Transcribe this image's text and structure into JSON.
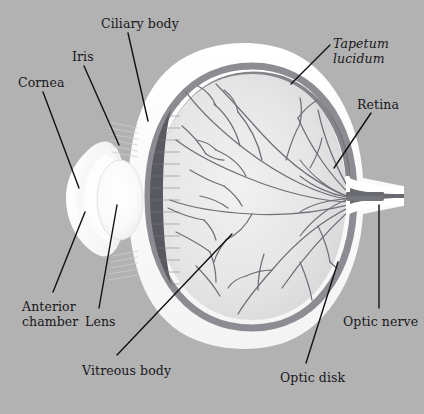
{
  "figure": {
    "kind": "anatomical-diagram",
    "background_color": "#b2b2b2",
    "label_color": "#17171a",
    "leader_line_color": "#111114"
  },
  "palette": {
    "sclera_white": "#ffffff",
    "outer_glow": "#f2f2f2",
    "retina_gray": "#8d8d92",
    "choroid_dark": "#5a5a61",
    "ciliary_dark": "#5b5b62",
    "vitreous_light": "#e9e9ea",
    "vitreous_shade": "#dcdcdd",
    "lens_white": "#fdfdfd",
    "vessel_gray": "#6e6e76",
    "optic_nerve_dark": "#6a6a71"
  },
  "labels": [
    {
      "id": "ciliary-body",
      "text": "Ciliary body",
      "x": 101,
      "y": 17,
      "italic": false
    },
    {
      "id": "tapetum-lucidum",
      "text": "Tapetum\nlucidum",
      "x": 333,
      "y": 37,
      "italic": true
    },
    {
      "id": "iris",
      "text": "Iris",
      "x": 72,
      "y": 50,
      "italic": false
    },
    {
      "id": "cornea",
      "text": "Cornea",
      "x": 18,
      "y": 76,
      "italic": false
    },
    {
      "id": "retina",
      "text": "Retina",
      "x": 357,
      "y": 98,
      "italic": false
    },
    {
      "id": "anterior-chamber",
      "text": "Anterior\nchamber",
      "x": 22,
      "y": 300,
      "italic": false
    },
    {
      "id": "lens",
      "text": "Lens",
      "x": 85,
      "y": 315,
      "italic": false
    },
    {
      "id": "optic-nerve",
      "text": "Optic nerve",
      "x": 343,
      "y": 315,
      "italic": false
    },
    {
      "id": "vitreous-body",
      "text": "Vitreous body",
      "x": 82,
      "y": 364,
      "italic": false
    },
    {
      "id": "optic-disk",
      "text": "Optic disk",
      "x": 280,
      "y": 371,
      "italic": false
    }
  ],
  "leader_lines": [
    {
      "id": "leader-ciliary-body",
      "x1": 128,
      "y1": 33,
      "x2": 148,
      "y2": 121
    },
    {
      "id": "leader-tapetum-lucidum",
      "x1": 330,
      "y1": 45,
      "x2": 291,
      "y2": 84
    },
    {
      "id": "leader-iris",
      "x1": 84,
      "y1": 66,
      "x2": 119,
      "y2": 145
    },
    {
      "id": "leader-cornea",
      "x1": 43,
      "y1": 92,
      "x2": 79,
      "y2": 188
    },
    {
      "id": "leader-retina",
      "x1": 371,
      "y1": 113,
      "x2": 334,
      "y2": 168
    },
    {
      "id": "leader-anterior-chamber",
      "x1": 53,
      "y1": 292,
      "x2": 85,
      "y2": 212
    },
    {
      "id": "leader-lens",
      "x1": 99,
      "y1": 308,
      "x2": 117,
      "y2": 205
    },
    {
      "id": "leader-optic-nerve",
      "x1": 379,
      "y1": 308,
      "x2": 379,
      "y2": 205
    },
    {
      "id": "leader-vitreous-body",
      "x1": 117,
      "y1": 355,
      "x2": 232,
      "y2": 234
    },
    {
      "id": "leader-optic-disk",
      "x1": 306,
      "y1": 363,
      "x2": 338,
      "y2": 262
    }
  ],
  "structures": [
    {
      "id": "sclera",
      "name": "sclera"
    },
    {
      "id": "cornea",
      "name": "cornea"
    },
    {
      "id": "anterior-chamber",
      "name": "anterior-chamber"
    },
    {
      "id": "lens",
      "name": "lens"
    },
    {
      "id": "iris",
      "name": "iris"
    },
    {
      "id": "ciliary-body",
      "name": "ciliary-body"
    },
    {
      "id": "vitreous-body",
      "name": "vitreous-body"
    },
    {
      "id": "retina",
      "name": "retina"
    },
    {
      "id": "tapetum-lucidum",
      "name": "tapetum-lucidum"
    },
    {
      "id": "optic-disk",
      "name": "optic-disk"
    },
    {
      "id": "optic-nerve",
      "name": "optic-nerve"
    },
    {
      "id": "retinal-vessels",
      "name": "retinal-blood-vessels"
    }
  ]
}
